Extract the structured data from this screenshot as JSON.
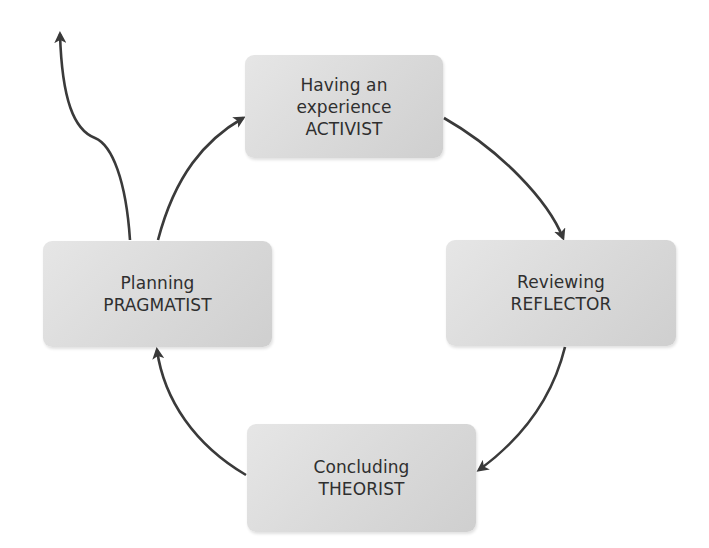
{
  "diagram": {
    "title": "",
    "type": "learning-styles-cycle",
    "colors": {
      "box_fill": "#d9d9d9",
      "text": "#2f2f2f",
      "arrow": "#3a3a3a",
      "background": "#ffffff"
    },
    "nodes": [
      {
        "id": "activist",
        "position": "top",
        "lines": [
          "Having an",
          "experience",
          "ACTIVIST"
        ]
      },
      {
        "id": "reflector",
        "position": "right",
        "lines": [
          "Reviewing",
          "REFLECTOR"
        ]
      },
      {
        "id": "theorist",
        "position": "bottom",
        "lines": [
          "Concluding",
          "THEORIST"
        ]
      },
      {
        "id": "pragmatist",
        "position": "left",
        "lines": [
          "Planning",
          "PRAGMATIST"
        ]
      }
    ],
    "edges": [
      {
        "from": "activist",
        "to": "reflector",
        "direction": "clockwise"
      },
      {
        "from": "reflector",
        "to": "theorist",
        "direction": "clockwise"
      },
      {
        "from": "theorist",
        "to": "pragmatist",
        "direction": "clockwise"
      },
      {
        "from": "pragmatist",
        "to": "activist",
        "direction": "clockwise"
      },
      {
        "from": "pragmatist",
        "to": "exit",
        "direction": "outward-up",
        "label": ""
      }
    ]
  }
}
